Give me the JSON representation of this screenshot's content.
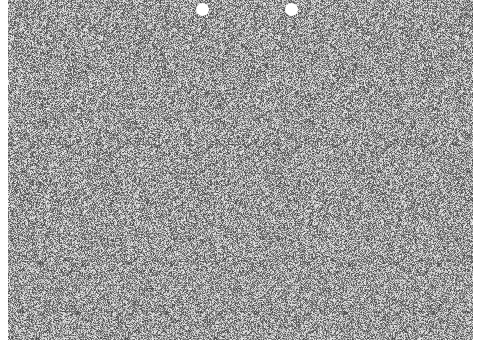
{
  "image": {
    "type": "autostereogram",
    "description": "Random-dot stereogram with grey noise texture",
    "noise_colors": {
      "dark": "#505050",
      "mid": "#9a9a9a",
      "light": "#e0e0e0"
    },
    "background": "#ffffff"
  },
  "guides": [
    {
      "name": "left-guide-dot",
      "x": 202,
      "y": 9
    },
    {
      "name": "right-guide-dot",
      "x": 291,
      "y": 9
    }
  ],
  "caption": ""
}
